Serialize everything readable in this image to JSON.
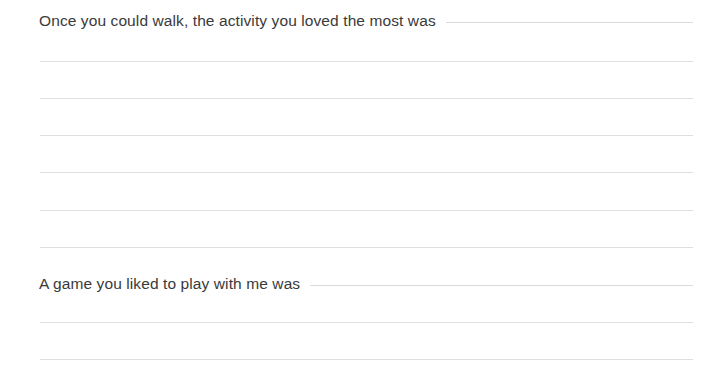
{
  "page": {
    "background_color": "#ffffff",
    "text_color": "#3a3a3a",
    "rule_color": "#dfdfdf",
    "left_margin_px": 39,
    "rule_right_edge_px": 693
  },
  "sections": [
    {
      "id": "activity-you-loved",
      "prompt": "Once you could walk, the activity you loved the most was",
      "prompt_top": 11,
      "lines_top": 61,
      "line_spacing": 37,
      "line_count": 6,
      "line_tops": [
        61,
        98,
        135,
        172,
        210,
        247
      ]
    },
    {
      "id": "game-you-liked",
      "prompt": "A game you liked to play with me was",
      "prompt_top": 274,
      "lines_top": 322,
      "line_spacing": 37,
      "line_count": 2,
      "line_tops": [
        322,
        359
      ]
    }
  ]
}
